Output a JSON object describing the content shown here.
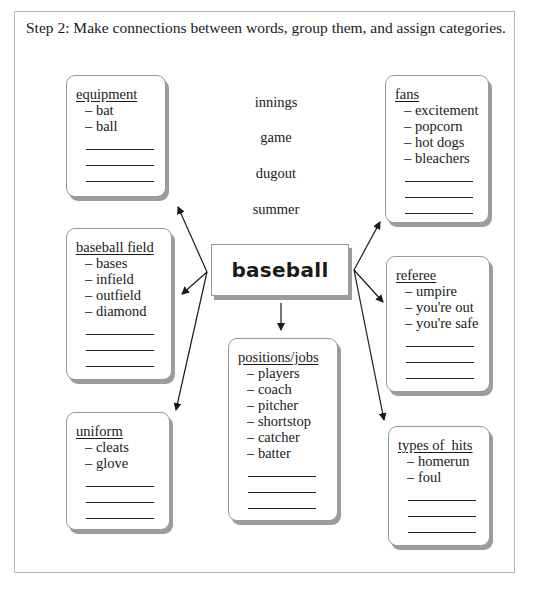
{
  "instruction": "Step 2: Make connections between words, group them, and assign categories.",
  "center": {
    "label": "baseball"
  },
  "loose_words": [
    "innings",
    "game",
    "dugout",
    "summer"
  ],
  "cards": {
    "equipment": {
      "title": "equipment",
      "items": [
        "– bat",
        "– ball"
      ],
      "blank_lines": 3
    },
    "fans": {
      "title": "fans",
      "items": [
        "– excitement",
        "– popcorn",
        "– hot dogs",
        "– bleachers"
      ],
      "blank_lines": 3
    },
    "baseball_field": {
      "title": "baseball field",
      "items": [
        "– bases",
        "– infield",
        "– outfield",
        "– diamond"
      ],
      "blank_lines": 3
    },
    "referee": {
      "title": "referee",
      "items": [
        "– umpire",
        "– you're out",
        "– you're safe"
      ],
      "blank_lines": 3
    },
    "positions_jobs": {
      "title": "positions/jobs",
      "items": [
        "– players",
        "– coach",
        "– pitcher",
        "– shortstop",
        "– catcher",
        "– batter"
      ],
      "blank_lines": 3
    },
    "uniform": {
      "title": "uniform",
      "items": [
        "– cleats",
        "– glove"
      ],
      "blank_lines": 3
    },
    "types_of_hits": {
      "title": "types of  hits",
      "items": [
        "– homerun",
        "– foul"
      ],
      "blank_lines": 3
    }
  },
  "colors": {
    "border": "#9a9a9a",
    "shadow": "#9c9c9c",
    "text": "#1a1a1a",
    "frame": "#b5b5b5"
  }
}
